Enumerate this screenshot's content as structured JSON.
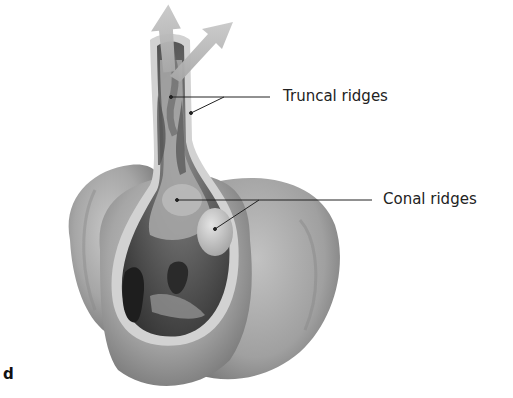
{
  "figure": {
    "panel_letter": "d",
    "labels": [
      {
        "text": "Truncal ridges",
        "x": 283,
        "y": 85
      },
      {
        "text": "Conal ridges",
        "x": 383,
        "y": 190
      }
    ],
    "colors": {
      "background": "#ffffff",
      "heart_outer": "#9a9a9a",
      "heart_light": "#c4c4c4",
      "cavity_dark": "#3a3a3a",
      "wall_rim": "#d6d6d6",
      "arrow": "#b8b8b8",
      "leader_line": "#222222"
    }
  }
}
